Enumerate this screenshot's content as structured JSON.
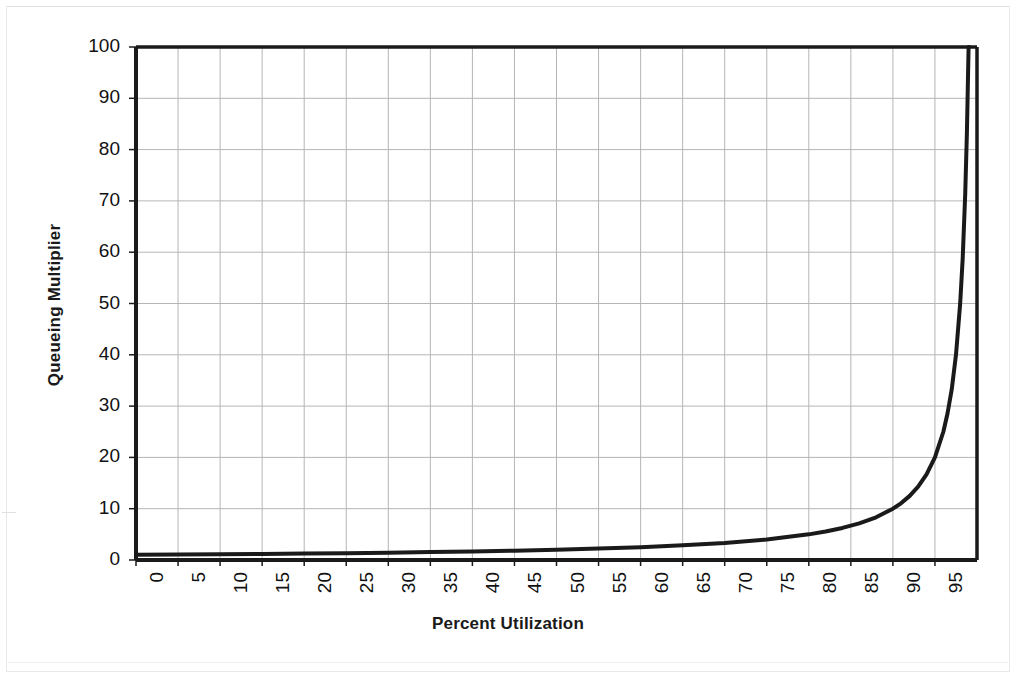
{
  "chart_data": {
    "type": "line",
    "title": "",
    "xlabel": "Percent Utilization",
    "ylabel": "Queueing Multiplier",
    "xlim": [
      0,
      100
    ],
    "ylim": [
      0,
      100
    ],
    "grid": true,
    "legend_position": "none",
    "x_ticks": [
      0,
      5,
      10,
      15,
      20,
      25,
      30,
      35,
      40,
      45,
      50,
      55,
      60,
      65,
      70,
      75,
      80,
      85,
      90,
      95
    ],
    "y_ticks": [
      0,
      10,
      20,
      30,
      40,
      50,
      60,
      70,
      80,
      90,
      100
    ],
    "x_tick_labels": [
      "0",
      "5",
      "10",
      "15",
      "20",
      "25",
      "30",
      "35",
      "40",
      "45",
      "50",
      "55",
      "60",
      "65",
      "70",
      "75",
      "80",
      "85",
      "90",
      "95"
    ],
    "y_tick_labels": [
      "0",
      "10",
      "20",
      "30",
      "40",
      "50",
      "60",
      "70",
      "80",
      "90",
      "100"
    ],
    "series": [
      {
        "name": "Queueing Multiplier",
        "formula": "1 / (1 - utilization/100)",
        "color": "#1a1a1a",
        "line_width": 4,
        "x": [
          0,
          5,
          10,
          15,
          20,
          25,
          30,
          35,
          40,
          45,
          50,
          55,
          60,
          65,
          70,
          75,
          80,
          82,
          84,
          86,
          88,
          90,
          91,
          92,
          93,
          94,
          95,
          96,
          96.5,
          97,
          97.5,
          98,
          98.3,
          98.6,
          98.8,
          99,
          99.05
        ],
        "values": [
          1,
          1.05,
          1.11,
          1.18,
          1.25,
          1.33,
          1.43,
          1.54,
          1.67,
          1.82,
          2,
          2.22,
          2.5,
          2.86,
          3.33,
          4,
          5,
          5.56,
          6.25,
          7.14,
          8.33,
          10,
          11.1,
          12.5,
          14.3,
          16.7,
          20,
          25,
          28.6,
          33.3,
          40,
          50,
          58.8,
          71.4,
          83.3,
          100,
          100
        ]
      }
    ],
    "annotations": []
  },
  "figure": {
    "background_color": "#ffffff",
    "plot_border_color": "#1a1a1a",
    "grid_color": "#b5b5b5",
    "axis_line_color": "#1a1a1a"
  }
}
